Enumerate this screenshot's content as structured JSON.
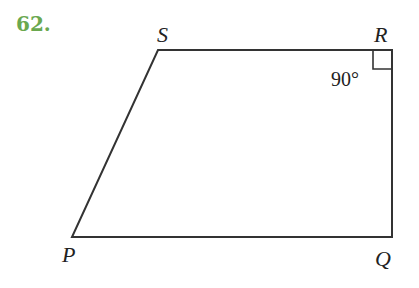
{
  "problem": {
    "number": "62."
  },
  "figure": {
    "type": "trapezoid",
    "vertices": {
      "S": {
        "label": "S",
        "x": 158,
        "y": 50
      },
      "R": {
        "label": "R",
        "x": 392,
        "y": 50
      },
      "Q": {
        "label": "Q",
        "x": 392,
        "y": 237
      },
      "P": {
        "label": "P",
        "x": 72,
        "y": 237
      }
    },
    "angle_label": "90°",
    "right_angle_at": "R",
    "colors": {
      "number": "#6aa84f",
      "line": "#333333"
    }
  }
}
